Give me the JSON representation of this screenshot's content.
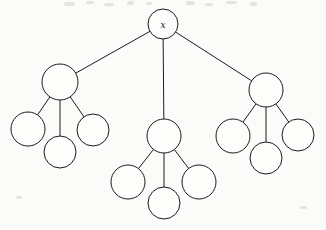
{
  "figure": {
    "kind": "rooted-tree-diagram",
    "title": "",
    "background_color": "#fbfbf9",
    "stroke_color": "#1b1b1b",
    "node_fill_color": "#fdfdfb",
    "width": 326,
    "height": 230
  },
  "nodes": [
    {
      "id": "root",
      "label": "x",
      "cx": 163,
      "cy": 24,
      "r": 15,
      "level": 0
    },
    {
      "id": "l",
      "label": "",
      "cx": 60,
      "cy": 82,
      "r": 18,
      "level": 1
    },
    {
      "id": "m",
      "label": "",
      "cx": 164,
      "cy": 136,
      "r": 17,
      "level": 1
    },
    {
      "id": "r",
      "label": "",
      "cx": 266,
      "cy": 90,
      "r": 17,
      "level": 1
    },
    {
      "id": "l1",
      "label": "",
      "cx": 28,
      "cy": 129,
      "r": 17,
      "level": 2
    },
    {
      "id": "l2",
      "label": "",
      "cx": 60,
      "cy": 152,
      "r": 16,
      "level": 2
    },
    {
      "id": "l3",
      "label": "",
      "cx": 93,
      "cy": 130,
      "r": 16,
      "level": 2
    },
    {
      "id": "m1",
      "label": "",
      "cx": 128,
      "cy": 182,
      "r": 17,
      "level": 2
    },
    {
      "id": "m2",
      "label": "",
      "cx": 164,
      "cy": 203,
      "r": 16,
      "level": 2
    },
    {
      "id": "m3",
      "label": "",
      "cx": 199,
      "cy": 182,
      "r": 17,
      "level": 2
    },
    {
      "id": "r1",
      "label": "",
      "cx": 233,
      "cy": 136,
      "r": 17,
      "level": 2
    },
    {
      "id": "r2",
      "label": "",
      "cx": 266,
      "cy": 158,
      "r": 16,
      "level": 2
    },
    {
      "id": "r3",
      "label": "",
      "cx": 298,
      "cy": 135,
      "r": 16,
      "level": 2
    }
  ],
  "edges": [
    {
      "from": "root",
      "to": "l"
    },
    {
      "from": "root",
      "to": "m"
    },
    {
      "from": "root",
      "to": "r"
    },
    {
      "from": "l",
      "to": "l1"
    },
    {
      "from": "l",
      "to": "l2"
    },
    {
      "from": "l",
      "to": "l3"
    },
    {
      "from": "m",
      "to": "m1"
    },
    {
      "from": "m",
      "to": "m2"
    },
    {
      "from": "m",
      "to": "m3"
    },
    {
      "from": "r",
      "to": "r1"
    },
    {
      "from": "r",
      "to": "r2"
    },
    {
      "from": "r",
      "to": "r3"
    }
  ],
  "artifacts": [
    {
      "x": 64,
      "y": 2,
      "w": 11,
      "h": 4
    },
    {
      "x": 86,
      "y": 1,
      "w": 8,
      "h": 3
    },
    {
      "x": 104,
      "y": 3,
      "w": 10,
      "h": 3
    },
    {
      "x": 127,
      "y": 1,
      "w": 7,
      "h": 4
    },
    {
      "x": 146,
      "y": 2,
      "w": 6,
      "h": 3
    },
    {
      "x": 186,
      "y": 1,
      "w": 9,
      "h": 4
    },
    {
      "x": 205,
      "y": 3,
      "w": 8,
      "h": 3
    },
    {
      "x": 226,
      "y": 1,
      "w": 11,
      "h": 3
    },
    {
      "x": 250,
      "y": 2,
      "w": 7,
      "h": 4
    },
    {
      "x": 16,
      "y": 196,
      "w": 6,
      "h": 3
    },
    {
      "x": 300,
      "y": 206,
      "w": 7,
      "h": 3
    }
  ]
}
